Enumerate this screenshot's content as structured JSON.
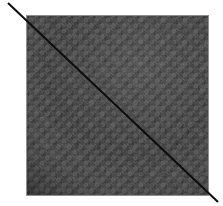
{
  "canvas": {
    "width": 223,
    "height": 206,
    "background_color": "#ffffff"
  },
  "figure": {
    "title": "textured-square-with-diagonal",
    "description": "A dark gray knitted fabric swatch drawn as a square, crossed corner to corner by a single thin black diagonal line that overshoots both corners into the white margin."
  },
  "square": {
    "name": "fabric-swatch",
    "x": 26,
    "y": 15,
    "width": 183,
    "height": 181,
    "border_color": "#8f8f8f",
    "border_width": 1,
    "base_color": "#3a3a3a",
    "shadow_color": "#1e1e1e",
    "midtone_color": "#4a4a4a",
    "highlight_color": "#5c5c5c",
    "texture": {
      "name": "knit-leaf-weave",
      "motif": "leaf",
      "tile_size": 11,
      "orientation_degrees": 35,
      "rows": 17,
      "columns": 17
    }
  },
  "diagonal_line": {
    "name": "corner-to-corner-diagonal",
    "color": "#0d0d0d",
    "stroke_width": 2,
    "x1": 8,
    "y1": 3,
    "x2": 218,
    "y2": 202,
    "direction": "top-left-to-bottom-right"
  }
}
